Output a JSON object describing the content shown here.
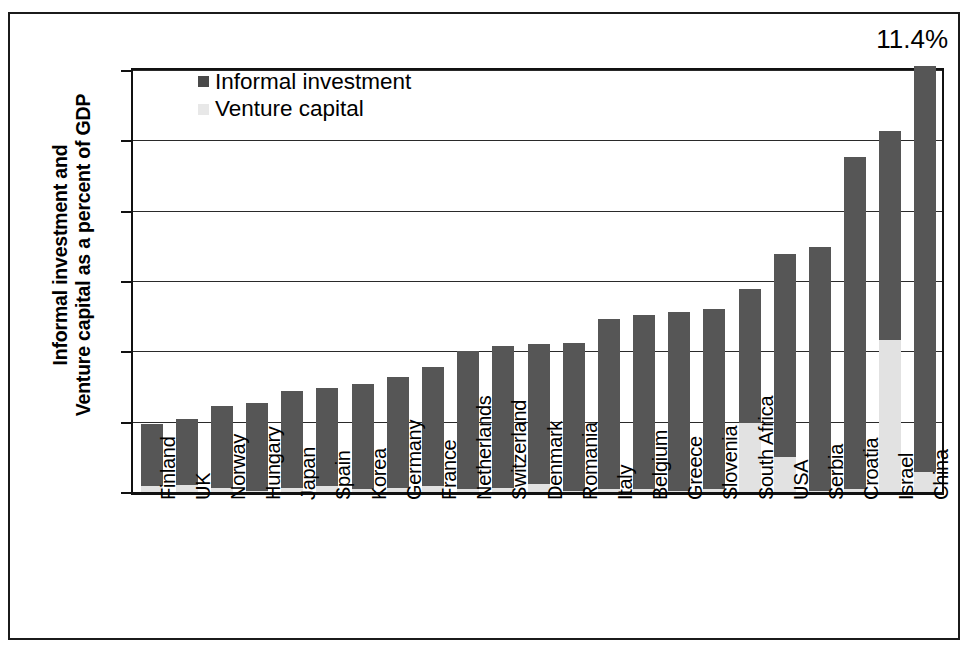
{
  "chart_data": {
    "type": "bar",
    "stacked": true,
    "title": "",
    "xlabel": "",
    "ylabel": "Informal investment and Venture capital as a percent of GDP",
    "ylim": [
      0,
      3
    ],
    "ytick_labels": [
      "0",
      "0.5",
      "1",
      "1.5",
      "2",
      "2.5",
      "3"
    ],
    "ytick_values": [
      0,
      0.5,
      1,
      1.5,
      2,
      2.5,
      3
    ],
    "grid": true,
    "legend_position": "top-left-inside",
    "categories": [
      "Finland",
      "UK",
      "Norway",
      "Hungary",
      "Japan",
      "Spain",
      "Korea",
      "Germany",
      "France",
      "Netherlands",
      "Switzerland",
      "Denmark",
      "Romania",
      "Italy",
      "Belgium",
      "Greece",
      "Slovenia",
      "South Africa",
      "USA",
      "Serbia",
      "Croatia",
      "Israel",
      "China"
    ],
    "series": [
      {
        "name": "Venture capital",
        "color": "#e2e2e2",
        "values": [
          0.04,
          0.05,
          0.03,
          0.01,
          0.03,
          0.04,
          0.02,
          0.03,
          0.04,
          0.02,
          0.03,
          0.06,
          0.01,
          0.02,
          0.02,
          0.01,
          0.02,
          0.49,
          0.25,
          0.01,
          0.02,
          1.08,
          0.14
        ]
      },
      {
        "name": "Informal investment",
        "color": "#565656",
        "values": [
          0.44,
          0.47,
          0.58,
          0.62,
          0.69,
          0.7,
          0.75,
          0.79,
          0.85,
          0.98,
          1.01,
          0.99,
          1.05,
          1.21,
          1.24,
          1.27,
          1.28,
          0.95,
          1.44,
          1.73,
          2.36,
          1.49,
          2.89
        ]
      }
    ],
    "totals": [
      0.48,
      0.52,
      0.61,
      0.63,
      0.72,
      0.74,
      0.77,
      0.82,
      0.89,
      1.0,
      1.04,
      1.05,
      1.06,
      1.23,
      1.26,
      1.28,
      1.3,
      1.44,
      1.69,
      1.74,
      2.38,
      2.57,
      3.03
    ],
    "annotations": [
      {
        "text": "11.4%",
        "for_category": "China",
        "position": "above-right"
      }
    ]
  },
  "legend": {
    "items": [
      {
        "label": "Informal investment",
        "swatch": "informal"
      },
      {
        "label": "Venture capital",
        "swatch": "vc"
      }
    ]
  },
  "y_axis": {
    "title_line1": "Informal investment and",
    "title_line2": "Venture capital as a percent of GDP"
  },
  "annotation": {
    "china_value": "11.4%"
  }
}
